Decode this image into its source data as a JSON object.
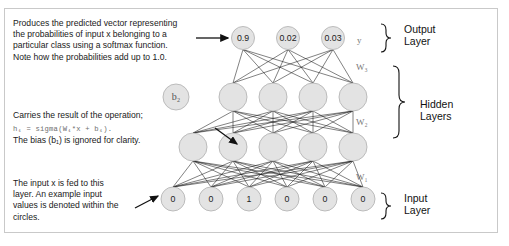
{
  "diagram": {
    "frame_border_color": "#c9c9c9",
    "node_fill": "#e3e3e3",
    "node_stroke": "#b5b5b5",
    "edge_color": "#1a1a1a",
    "label_color": "#777777"
  },
  "annotations": {
    "output_note": "Produces the predicted vector representing\nthe probabilities of input x belonging to a\nparticular class using a softmax function.\nNote how the probabilities add up to 1.0.",
    "hidden_note_line1": "Carries the result of the operation;",
    "hidden_note_formula": "h₁ = sigma(W₁*x + b₁).",
    "hidden_note_line3": "The bias (b₁) is ignored for clarity.",
    "input_note": "The input x is fed to this\nlayer. An example input\nvalues is denoted within the\ncircles."
  },
  "layers": {
    "output": {
      "values": [
        "0.9",
        "0.02",
        "0.03"
      ],
      "label": "y",
      "weight_label": "W₃",
      "brace_label": "Output\nLayer"
    },
    "hidden2": {
      "bias_node": "b₂",
      "node_count": 4,
      "values": [
        "",
        "",
        "",
        ""
      ],
      "label": "h₂",
      "weight_label": "W₂"
    },
    "hidden1": {
      "node_count": 5,
      "values": [
        "",
        "",
        "",
        "",
        ""
      ],
      "label": "h₁",
      "weight_label": "W₁"
    },
    "hidden_brace_label": "Hidden\nLayers",
    "input": {
      "values": [
        "0",
        "0",
        "1",
        "0",
        "0",
        "0"
      ],
      "label": "x",
      "brace_label": "Input\nLayer"
    }
  }
}
